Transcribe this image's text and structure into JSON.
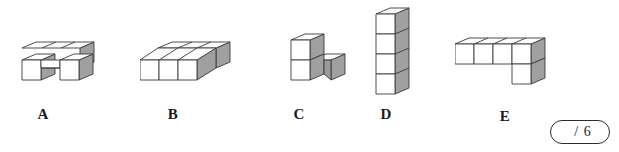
{
  "worksheet": {
    "title": "Cube structures multiple choice row",
    "background_color": "#ffffff"
  },
  "palette": {
    "outline": "#3a3a3a",
    "top_face": "#fdfdfd",
    "front_face": "#ffffff",
    "side_face": "#a0a0a0",
    "label_color": "#1a1a1a",
    "score_border": "#2b2b2b"
  },
  "shapes": [
    {
      "label": "A",
      "name": "cube-shape-a",
      "description": "Two rows of three cubes deep with the front middle cube missing",
      "cube_count": 5
    },
    {
      "label": "B",
      "name": "cube-shape-b",
      "description": "Solid slab three cubes wide and two cubes deep",
      "cube_count": 6
    },
    {
      "label": "C",
      "name": "cube-shape-c",
      "description": "Two cubes stacked vertically with one cube attached behind at the base",
      "cube_count": 3
    },
    {
      "label": "D",
      "name": "cube-shape-d",
      "description": "Vertical tower of four cubes",
      "cube_count": 4
    },
    {
      "label": "E",
      "name": "cube-shape-e",
      "description": "Row of four cubes with one cube below the right end",
      "cube_count": 5
    }
  ],
  "score": {
    "value": "",
    "separator": "/",
    "total": "6",
    "display": "/ 6"
  }
}
